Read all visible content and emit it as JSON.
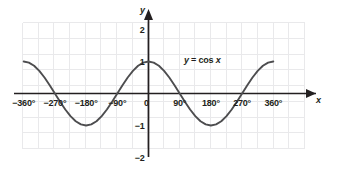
{
  "chart_data": {
    "type": "line",
    "title": "",
    "annotation": "y = cos x",
    "annotation_parts": {
      "lhs": "y",
      "operator": " = cos ",
      "variable": "x"
    },
    "xlabel": "x",
    "ylabel": "y",
    "xlim": [
      -405,
      405
    ],
    "ylim": [
      -2.2,
      2.2
    ],
    "grid": true,
    "grid_color": "#e8e8ea",
    "curve_color": "#4d4d4f",
    "axis_color": "#231f20",
    "background": "#ffffff",
    "legend": "none",
    "x_ticks": [
      {
        "value": -360,
        "label": "−360°"
      },
      {
        "value": -270,
        "label": "−270°"
      },
      {
        "value": -180,
        "label": "−180°"
      },
      {
        "value": -90,
        "label": "−90°"
      },
      {
        "value": 0,
        "label": "0"
      },
      {
        "value": 90,
        "label": "90°"
      },
      {
        "value": 180,
        "label": "180°"
      },
      {
        "value": 270,
        "label": "270°"
      },
      {
        "value": 360,
        "label": "360°"
      }
    ],
    "y_ticks": [
      {
        "value": 2,
        "label": "2"
      },
      {
        "value": 1,
        "label": "1"
      },
      {
        "value": -1,
        "label": "−1"
      },
      {
        "value": -2,
        "label": "−2"
      }
    ],
    "series": [
      {
        "name": "y = cos x",
        "x": [
          -360,
          -345,
          -330,
          -315,
          -300,
          -285,
          -270,
          -255,
          -240,
          -225,
          -210,
          -195,
          -180,
          -165,
          -150,
          -135,
          -120,
          -105,
          -90,
          -75,
          -60,
          -45,
          -30,
          -15,
          0,
          15,
          30,
          45,
          60,
          75,
          90,
          105,
          120,
          135,
          150,
          165,
          180,
          195,
          210,
          225,
          240,
          255,
          270,
          285,
          300,
          315,
          330,
          345,
          360
        ],
        "values": [
          1,
          0.966,
          0.866,
          0.707,
          0.5,
          0.259,
          0,
          -0.259,
          -0.5,
          -0.707,
          -0.866,
          -0.966,
          -1,
          -0.966,
          -0.866,
          -0.707,
          -0.5,
          -0.259,
          0,
          0.259,
          0.5,
          0.707,
          0.866,
          0.966,
          1,
          0.966,
          0.866,
          0.707,
          0.5,
          0.259,
          0,
          -0.259,
          -0.5,
          -0.707,
          -0.866,
          -0.966,
          -1,
          -0.966,
          -0.866,
          -0.707,
          -0.5,
          -0.259,
          0,
          0.259,
          0.5,
          0.707,
          0.866,
          0.966,
          1
        ]
      }
    ],
    "key_points": {
      "maxima_deg": [
        -360,
        0,
        360
      ],
      "minima_deg": [
        -180,
        180
      ],
      "zeros_deg": [
        -270,
        -90,
        90,
        270
      ],
      "amplitude": 1,
      "period_deg": 360
    }
  }
}
